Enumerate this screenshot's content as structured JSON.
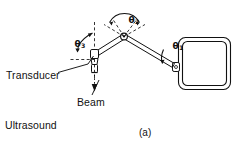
{
  "figure": {
    "caption": "(a)",
    "background_color": "#ffffff",
    "ink_color": "#111111",
    "width": 237,
    "height": 153
  },
  "labels": {
    "transducer": "Transducer",
    "ultrasound": "Ultrasound",
    "direction": "Direction",
    "beam": "Beam"
  },
  "angles": {
    "theta1": {
      "symbol": "θ",
      "subscript": "1"
    },
    "theta2": {
      "symbol": "θ",
      "subscript": "2"
    },
    "theta3": {
      "symbol": "θ",
      "subscript": "3"
    }
  },
  "parts": {
    "display_unit": "display-unit",
    "upper_arm": "upper-arm-link",
    "lower_arm": "lower-arm-link",
    "apex_joint": "apex-pivot-joint",
    "display_joint": "display-pivot-joint",
    "transducer_probe": "transducer-probe",
    "beam_axis": "ultrasound-beam-axis"
  }
}
